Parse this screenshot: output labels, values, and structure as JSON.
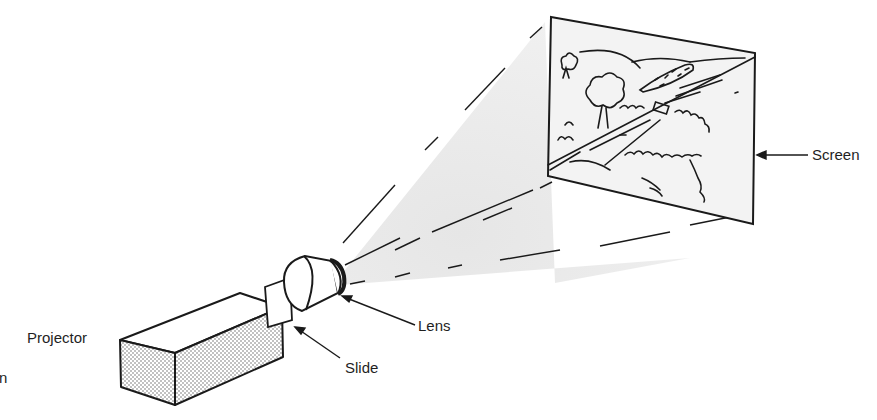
{
  "diagram": {
    "labels": {
      "projector": "Projector",
      "slide": "Slide",
      "lens": "Lens",
      "screen": "Screen",
      "cutoff_fragment": "n"
    },
    "components": [
      "projector",
      "slide",
      "lens",
      "light-beam",
      "screen",
      "projected-landscape-image"
    ],
    "colors": {
      "line": "#1a1a1a",
      "beam": "#ececec",
      "screen_fill": "#f1f1f1",
      "stipple": "#555555"
    }
  }
}
